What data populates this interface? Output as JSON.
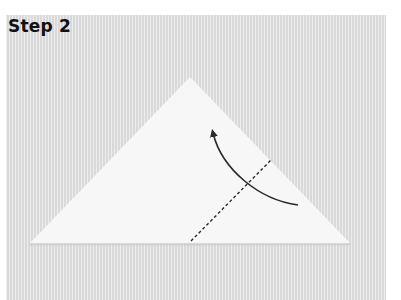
{
  "step": {
    "title": "Step 2"
  },
  "diagram": {
    "colors": {
      "background": "#e2e2e2",
      "paper": "#f7f7f7",
      "paper_shadow": "#cfcfcf",
      "line": "#2a2a2a"
    },
    "paper_triangle": {
      "apex": [
        190,
        77
      ],
      "bottom_left": [
        30,
        243
      ],
      "bottom_right": [
        350,
        243
      ]
    },
    "fold_line": {
      "style": "dashed",
      "from": [
        191,
        241
      ],
      "to": [
        271,
        160
      ]
    },
    "fold_arrow": {
      "icon": "curved-arrow-icon",
      "from": [
        298,
        205
      ],
      "to": [
        213,
        131
      ],
      "direction": "up-left"
    }
  }
}
